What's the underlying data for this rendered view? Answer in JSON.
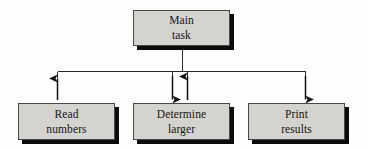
{
  "diagram": {
    "type": "structure-chart",
    "canvas": {
      "width": 367,
      "height": 148
    },
    "style": {
      "box_fill": "#d5d3d0",
      "box_border": "#4a4844",
      "box_shadow": "#0b0b0b",
      "line_color": "#2b2b2b",
      "background": "#fdfdfc",
      "text_color": "#141414"
    },
    "nodes": [
      {
        "id": "main-task",
        "line1": "Main",
        "line2": "task",
        "role": "root",
        "x": 133,
        "y": 10,
        "w": 97,
        "h": 36
      },
      {
        "id": "read-numbers",
        "line1": "Read",
        "line2": "numbers",
        "role": "child",
        "x": 18,
        "y": 103,
        "w": 97,
        "h": 37
      },
      {
        "id": "determine-larger",
        "line1": "Determine",
        "line2": "larger",
        "role": "child",
        "x": 133,
        "y": 103,
        "w": 97,
        "h": 37
      },
      {
        "id": "print-results",
        "line1": "Print",
        "line2": "results",
        "role": "child",
        "x": 248,
        "y": 103,
        "w": 97,
        "h": 37
      }
    ],
    "connectors": {
      "trunk": {
        "from_x": 182,
        "from_y": 46,
        "to_y": 71
      },
      "bus": {
        "y": 71,
        "x_start": 57,
        "x_end": 305
      },
      "arrows": [
        {
          "id": "read-numbers-up",
          "x": 57,
          "direction": "up",
          "from_y": 100,
          "to_y": 76,
          "label": "data returned from Read numbers"
        },
        {
          "id": "determine-larger-down",
          "x": 172,
          "direction": "down",
          "from_y": 74,
          "to_y": 100,
          "label": "data passed to Determine larger"
        },
        {
          "id": "determine-larger-up",
          "x": 187,
          "direction": "up",
          "from_y": 100,
          "to_y": 74,
          "label": "result returned from Determine larger"
        },
        {
          "id": "print-results-down",
          "x": 305,
          "direction": "down",
          "from_y": 74,
          "to_y": 100,
          "label": "data passed to Print results"
        }
      ]
    }
  }
}
